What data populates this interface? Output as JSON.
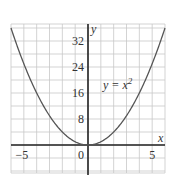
{
  "chart_data": {
    "type": "line",
    "title": "",
    "xlabel": "x",
    "ylabel": "y",
    "xlim": [
      -6,
      6
    ],
    "ylim": [
      -8,
      37
    ],
    "grid": true,
    "grid_x_step": 1,
    "grid_y_step": 4,
    "x_ticks": [
      -5,
      0,
      5
    ],
    "x_tick_labels": [
      "−5",
      "0",
      "5"
    ],
    "y_ticks": [
      8,
      16,
      24,
      32
    ],
    "y_tick_labels": [
      "8",
      "16",
      "24",
      "32"
    ],
    "series": [
      {
        "name": "y = x^2",
        "function": "x^2",
        "x": [
          -6,
          -5,
          -4,
          -3,
          -2,
          -1,
          0,
          1,
          2,
          3,
          4,
          5,
          6
        ],
        "values": [
          36,
          25,
          16,
          9,
          4,
          1,
          0,
          1,
          4,
          9,
          16,
          25,
          36
        ],
        "color": "#555555"
      }
    ],
    "annotations": [
      {
        "text": "y = x²",
        "x": 1.3,
        "y": 18
      }
    ],
    "legend": "none"
  },
  "colors": {
    "grid": "#c8c8c8",
    "axis": "#222222",
    "curve": "#555555",
    "text": "#333333"
  },
  "labels": {
    "x_axis": "x",
    "y_axis": "y",
    "annotation_prefix": "y = x",
    "annotation_exp": "2"
  }
}
